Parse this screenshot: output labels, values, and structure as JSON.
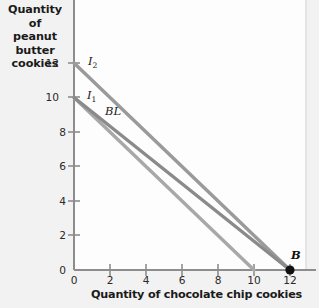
{
  "chart_data": {
    "type": "line",
    "title": "",
    "ylabel": "Quantity of peanut butter cookies",
    "xlabel": "Quantity of chocolate chip cookies",
    "xlim": [
      0,
      13.2
    ],
    "ylim": [
      0,
      13.4
    ],
    "xticks": [
      "0",
      "2",
      "4",
      "6",
      "8",
      "10",
      "12"
    ],
    "yticks": [
      "0",
      "2",
      "4",
      "6",
      "8",
      "10",
      "12"
    ],
    "grid": false,
    "legend": "inline-labels",
    "series": [
      {
        "name": "I2",
        "label": "I",
        "sub": "2",
        "color": "#9a9a9a",
        "points": [
          [
            0,
            12
          ],
          [
            12,
            0
          ]
        ],
        "label_x": 1.0,
        "label_y": 12.5
      },
      {
        "name": "BL",
        "label": "BL",
        "sub": "",
        "color": "#8a8a8a",
        "points": [
          [
            0,
            10
          ],
          [
            12,
            0
          ]
        ],
        "label_x": 1.75,
        "label_y": 9.55
      },
      {
        "name": "I1",
        "label": "I",
        "sub": "1",
        "color": "#a8a8a8",
        "points": [
          [
            0,
            10
          ],
          [
            10,
            0
          ]
        ],
        "label_x": 0.95,
        "label_y": 10.55
      }
    ],
    "annotations": [
      {
        "name": "point-B",
        "label": "B",
        "x": 12,
        "y": 0,
        "marker": "filled-circle",
        "color": "#111111"
      }
    ],
    "colors": {
      "plot_background": "#fdfdfd",
      "page_background": "#f2f2f2",
      "axis": "#8d8d8d",
      "text": "#1a1a1a"
    }
  },
  "ylabel_lines": [
    "Quantity of",
    "peanut butter",
    "cookies"
  ],
  "xlabel_text": "Quantity of chocolate chip cookies"
}
